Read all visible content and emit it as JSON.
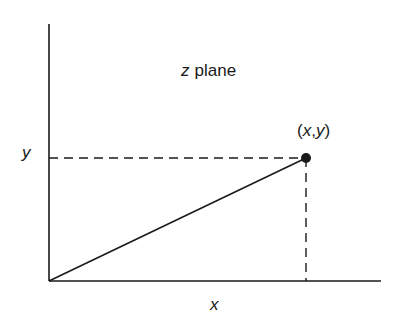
{
  "diagram": {
    "title_var": "z",
    "title_word": "plane",
    "point_label": "(x,y)",
    "point_label_parts": {
      "open": "(",
      "x": "x",
      "comma": ",",
      "y": "y",
      "close": ")"
    },
    "x_axis_label": "x",
    "y_axis_label": "y",
    "colors": {
      "stroke": "#1a1a1a",
      "background": "#ffffff"
    },
    "elements": {
      "origin": [
        49,
        281
      ],
      "point": [
        306,
        158
      ],
      "y_axis_top": 24,
      "x_axis_right": 381
    }
  }
}
